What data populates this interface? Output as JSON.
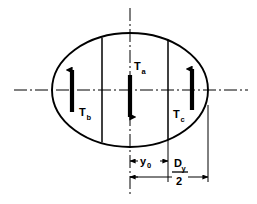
{
  "figure": {
    "type": "engineering-cross-section-diagram",
    "background_color": "#ffffff",
    "line_color": "#000000",
    "arrow_color": "#000000"
  },
  "labels": {
    "torque_a": {
      "base": "T",
      "sub": "a",
      "direction": "down"
    },
    "torque_b": {
      "base": "T",
      "sub": "b",
      "direction": "up"
    },
    "torque_c": {
      "base": "T",
      "sub": "c",
      "direction": "up"
    },
    "dim_y0": {
      "base": "y",
      "sub": "0"
    },
    "dim_dy_numerator": {
      "base": "D",
      "sub": "y"
    },
    "dim_dy_denominator": "2"
  },
  "geometry": {
    "ellipse": {
      "cx": 130,
      "cy": 90,
      "rx": 78,
      "ry": 57
    },
    "chord_left_x": 102,
    "chord_right_x": 168,
    "horizontal_axis": {
      "y": 90,
      "x_start": 14,
      "x_end": 248
    },
    "vertical_axis": {
      "x": 130,
      "y_start": 8,
      "y_end": 196
    },
    "dim_line_y0_y": 161,
    "dim_line_dy_y": 177
  }
}
